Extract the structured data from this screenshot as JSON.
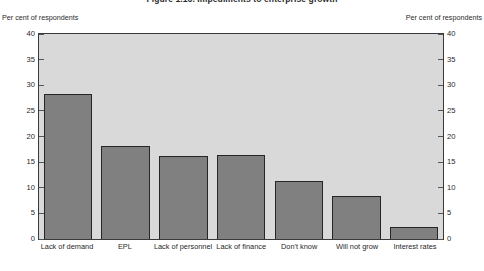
{
  "figure": {
    "title": "Figure 1.16. Impediments to enterprise growth",
    "left_axis_caption": "Per cent of respondents",
    "right_axis_caption": "Per cent of respondents"
  },
  "chart_data": {
    "type": "bar",
    "title": "Figure 1.16. Impediments to enterprise growth",
    "xlabel": "",
    "ylabel": "Per cent of respondents",
    "ylim": [
      0,
      40
    ],
    "yticks": [
      0,
      5,
      10,
      15,
      20,
      25,
      30,
      35,
      40
    ],
    "grid": false,
    "legend": null,
    "dual_axis": true,
    "right_ylabel": "Per cent of respondents",
    "categories": [
      "Lack of demand",
      "EPL",
      "Lack of personnel",
      "Lack of finance",
      "Don't know",
      "Will not grow",
      "Interest rates"
    ],
    "values": [
      28.2,
      18.2,
      16.2,
      16.3,
      11.3,
      8.4,
      2.3
    ],
    "colors": {
      "bar_fill": "#808080",
      "bar_border": "#262626",
      "plot_background": "#d9d9d9",
      "frame": "#3a3a3a",
      "page_background": "#ffffff",
      "text": "#1f1f1f"
    }
  }
}
